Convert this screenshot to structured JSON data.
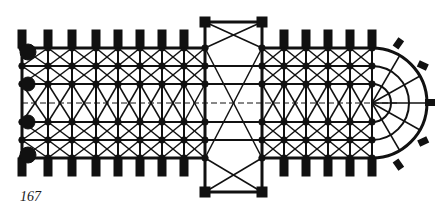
{
  "figure": {
    "number": "167",
    "ink_color": "#111111",
    "background": "#ffffff"
  },
  "plan": {
    "nave_bays_west": 9,
    "crossing": "transept",
    "choir_bays_east": 5,
    "apse": "semicircular with radiating chapels",
    "aisles_per_side": 2
  }
}
